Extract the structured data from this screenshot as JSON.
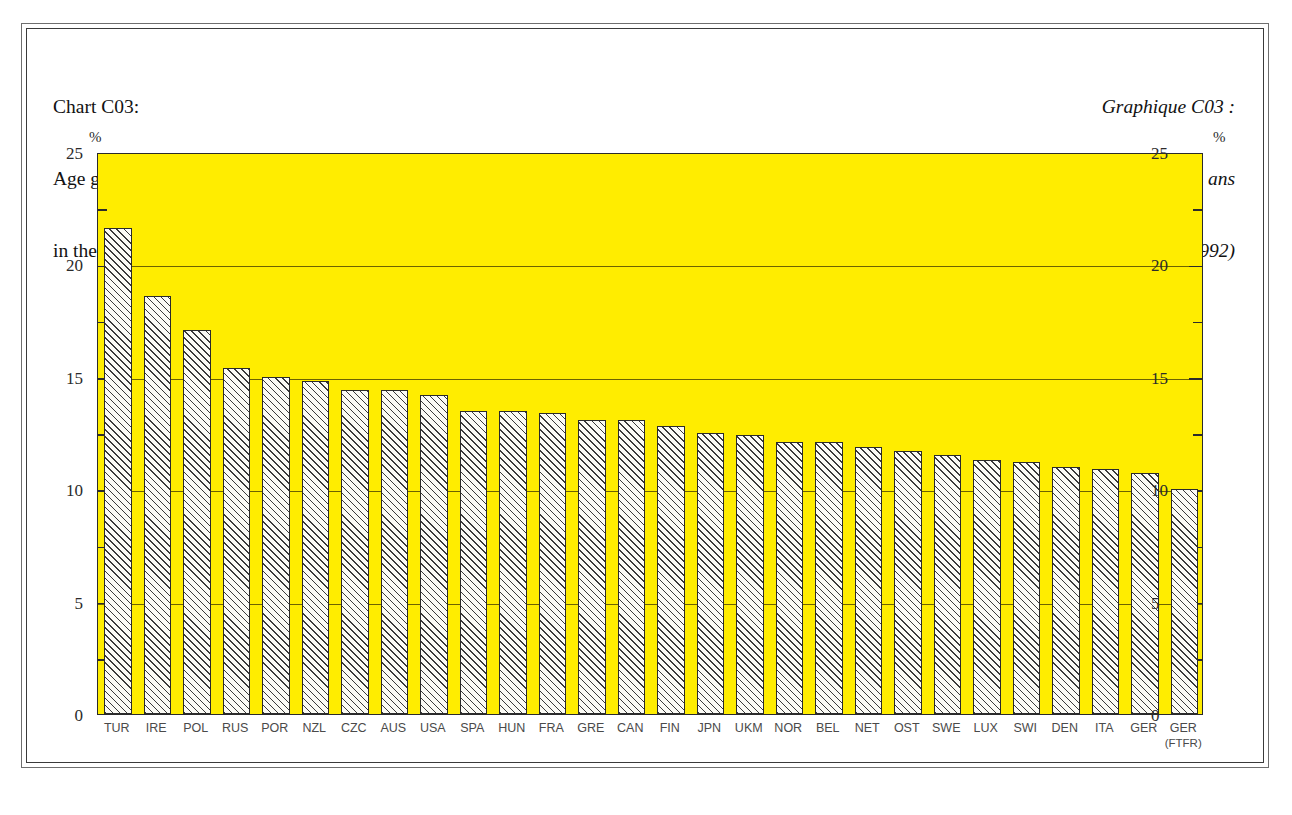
{
  "titles": {
    "english": [
      "Chart C03:",
      "Age group 5-14 years",
      "in the  total population (1992)"
    ],
    "french": [
      "Graphique C03 :",
      "Part des jeunes de 5 à 14 ans",
      "dans l'ensemble de la population (1992)"
    ]
  },
  "axis": {
    "unit_left": "%",
    "unit_right": "%",
    "y_ticks": [
      "0",
      "5",
      "10",
      "15",
      "20",
      "25"
    ],
    "y_tick_values": [
      0,
      5,
      10,
      15,
      20,
      25
    ],
    "y_minor_values": [
      2.5,
      7.5,
      12.5,
      17.5,
      22.5
    ]
  },
  "colors": {
    "plot_background": "#ffed00",
    "bar_fill": "#fbfbf5",
    "bar_hatch": "#3a3a3a",
    "axis": "#2b2b2b",
    "gridline": "#6d6200",
    "text": "#121212",
    "tick_label": "#2b2b2b",
    "x_label": "#4a4a4a"
  },
  "chart_data": {
    "type": "bar",
    "title": "Chart C03: Age group 5-14 years in the total population (1992)",
    "title_fr": "Graphique C03 : Part des jeunes de 5 à 14 ans dans l'ensemble de la population (1992)",
    "xlabel": "",
    "ylabel": "%",
    "ylim": [
      0,
      25
    ],
    "ytick_step": 5,
    "grid": true,
    "grid_axis": "y",
    "legend": null,
    "categories": [
      "TUR",
      "IRE",
      "POL",
      "RUS",
      "POR",
      "NZL",
      "CZC",
      "AUS",
      "USA",
      "SPA",
      "HUN",
      "FRA",
      "GRE",
      "CAN",
      "FIN",
      "JPN",
      "UKM",
      "NOR",
      "BEL",
      "NET",
      "OST",
      "SWE",
      "LUX",
      "SWI",
      "DEN",
      "ITA",
      "GER",
      "GER\n(FTFR)"
    ],
    "category_labels": [
      {
        "main": "TUR",
        "sub": ""
      },
      {
        "main": "IRE",
        "sub": ""
      },
      {
        "main": "POL",
        "sub": ""
      },
      {
        "main": "RUS",
        "sub": ""
      },
      {
        "main": "POR",
        "sub": ""
      },
      {
        "main": "NZL",
        "sub": ""
      },
      {
        "main": "CZC",
        "sub": ""
      },
      {
        "main": "AUS",
        "sub": ""
      },
      {
        "main": "USA",
        "sub": ""
      },
      {
        "main": "SPA",
        "sub": ""
      },
      {
        "main": "HUN",
        "sub": ""
      },
      {
        "main": "FRA",
        "sub": ""
      },
      {
        "main": "GRE",
        "sub": ""
      },
      {
        "main": "CAN",
        "sub": ""
      },
      {
        "main": "FIN",
        "sub": ""
      },
      {
        "main": "JPN",
        "sub": ""
      },
      {
        "main": "UKM",
        "sub": ""
      },
      {
        "main": "NOR",
        "sub": ""
      },
      {
        "main": "BEL",
        "sub": ""
      },
      {
        "main": "NET",
        "sub": ""
      },
      {
        "main": "OST",
        "sub": ""
      },
      {
        "main": "SWE",
        "sub": ""
      },
      {
        "main": "LUX",
        "sub": ""
      },
      {
        "main": "SWI",
        "sub": ""
      },
      {
        "main": "DEN",
        "sub": ""
      },
      {
        "main": "ITA",
        "sub": ""
      },
      {
        "main": "GER",
        "sub": ""
      },
      {
        "main": "GER",
        "sub": "(FTFR)"
      }
    ],
    "values": [
      21.6,
      18.6,
      17.1,
      15.4,
      15.0,
      14.8,
      14.4,
      14.4,
      14.2,
      13.5,
      13.5,
      13.4,
      13.1,
      13.1,
      12.8,
      12.5,
      12.4,
      12.1,
      12.1,
      11.9,
      11.7,
      11.5,
      11.3,
      11.2,
      11.0,
      10.9,
      10.7,
      10.0
    ]
  }
}
